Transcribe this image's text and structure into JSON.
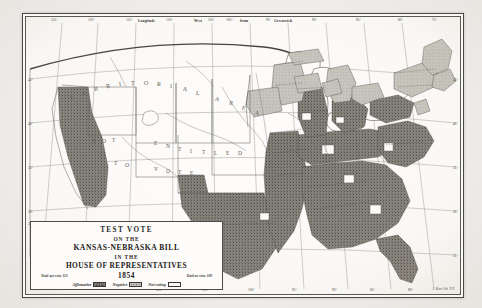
{
  "map": {
    "kind": "historical-engraved-map",
    "frame_style": "double-ruled-border",
    "margin": {
      "top_word_left": "Longitude",
      "top_word_mid": "West",
      "top_word_right": "from",
      "top_word_far": "Greenwich",
      "top_ticks": [
        "125°",
        "120°",
        "115°",
        "110°",
        "105°",
        "100°",
        "95°",
        "90°",
        "85°",
        "80°",
        "75°",
        "70°"
      ],
      "bottom_ticks": [
        "120°",
        "110°",
        "100°",
        "95°",
        "90°",
        "85°",
        "80°",
        "75°"
      ],
      "left_ticks": [
        "45°",
        "40°",
        "35°",
        "30°",
        "25°"
      ],
      "right_ticks": [
        "45°",
        "40°",
        "35°",
        "30°",
        "25°"
      ]
    },
    "geo_labels": [
      {
        "text": "TERRITORIAL AREA",
        "note": "spaced-arc across northern plains"
      },
      {
        "text": "NOT ENTITLED TO VOTE",
        "note": "spaced across unorganized territory"
      }
    ],
    "territorial_area_letters": [
      "T",
      "E",
      "R",
      "R",
      "I",
      "T",
      "O",
      "R",
      "I",
      "A",
      "L",
      "A",
      "R",
      "E",
      "A"
    ],
    "not_entitled_letters_line1": [
      "N",
      "O",
      "T"
    ],
    "not_entitled_letters_line2": [
      "E",
      "N",
      "T",
      "I",
      "T",
      "L",
      "E",
      "D"
    ],
    "not_entitled_letters_line3": [
      "T",
      "O"
    ],
    "not_entitled_letters_line4": [
      "V",
      "O",
      "T",
      "E"
    ],
    "credit": "J. Bien lith. N.Y."
  },
  "cartouche": {
    "line1": "TEST VOTE",
    "line2": "ON THE",
    "line3": "KANSAS-NEBRASKA BILL",
    "line4": "IN THE",
    "line5": "HOUSE OF REPRESENTATIVES",
    "year": "1854",
    "tally_aye": "Total aye vote, 113",
    "tally_no": "Total no vote, 100",
    "legend": [
      {
        "label": "Affirmative",
        "swatch": "dark-stipple",
        "color": "#8b8881"
      },
      {
        "label": "Negative",
        "swatch": "light-stipple",
        "color": "#c5c2bb"
      },
      {
        "label": "Not voting",
        "swatch": "blank",
        "color": "#fdfcfa"
      }
    ]
  },
  "colors": {
    "paper": "#f2f1ee",
    "plate": "#fdfcfa",
    "ink": "#4a4843",
    "affirmative": "#8b8881",
    "negative": "#c5c2bb",
    "not_voting": "#fdfcfa"
  }
}
